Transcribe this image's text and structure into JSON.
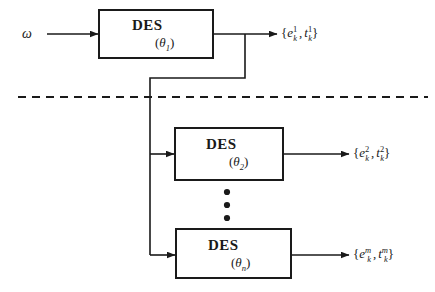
{
  "diagram": {
    "type": "block-diagram",
    "input": {
      "label": "ω",
      "name": "omega"
    },
    "divider": {
      "style": "dashed",
      "name": "dashed-separator"
    },
    "vertical_ellipsis": "⋮",
    "blocks": [
      {
        "id": "des-1",
        "title": "DES",
        "param_open": "(",
        "param_symbol": "θ",
        "param_sub": "1",
        "param_close": ")",
        "output": {
          "open": "{",
          "first_var": "e",
          "first_sub": "k",
          "first_sup": "1",
          "comma": ",",
          "second_var": "t",
          "second_sub": "k",
          "second_sup": "1",
          "close": "}"
        }
      },
      {
        "id": "des-2",
        "title": "DES",
        "param_open": "(",
        "param_symbol": "θ",
        "param_sub": "2",
        "param_close": ")",
        "output": {
          "open": "{",
          "first_var": "e",
          "first_sub": "k",
          "first_sup": "2",
          "comma": ",",
          "second_var": "t",
          "second_sub": "k",
          "second_sup": "2",
          "close": "}"
        }
      },
      {
        "id": "des-n",
        "title": "DES",
        "param_open": "(",
        "param_symbol": "θ",
        "param_sub": "n",
        "param_close": ")",
        "output": {
          "open": "{",
          "first_var": "e",
          "first_sub": "k",
          "first_sup": "m",
          "comma": ",",
          "second_var": "t",
          "second_sub": "k",
          "second_sup": "m",
          "close": "}"
        }
      }
    ],
    "colors": {
      "stroke": "#1a1a1a",
      "background": "#ffffff",
      "text": "#1a1a1a"
    }
  }
}
